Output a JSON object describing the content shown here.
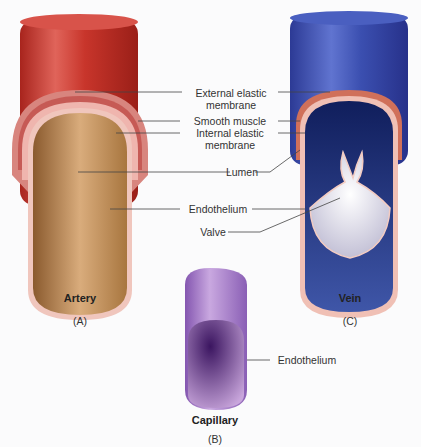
{
  "diagram": {
    "vessels": [
      {
        "id": "artery",
        "name": "Artery",
        "panel": "(A)",
        "color": "#c8352b"
      },
      {
        "id": "capillary",
        "name": "Capillary",
        "panel": "(B)",
        "color": "#9a6ec0"
      },
      {
        "id": "vein",
        "name": "Vein",
        "panel": "(C)",
        "color": "#3b4fb0"
      }
    ],
    "labels": {
      "external_elastic_1": "External elastic",
      "external_elastic_2": "membrane",
      "smooth_muscle": "Smooth muscle",
      "internal_elastic_1": "Internal elastic",
      "internal_elastic_2": "membrane",
      "lumen": "Lumen",
      "endothelium": "Endothelium",
      "valve": "Valve",
      "capillary_endothelium": "Endothelium"
    }
  }
}
